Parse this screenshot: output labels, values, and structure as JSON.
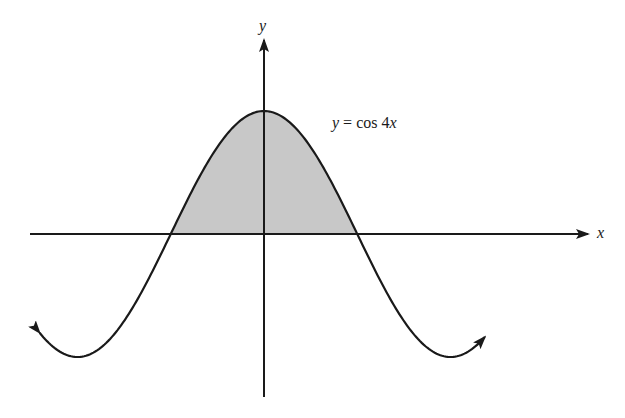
{
  "figure": {
    "function_label": {
      "var": "y",
      "eq": " = cos 4",
      "x": "x"
    },
    "x_axis_label": "x",
    "y_axis_label": "y",
    "colors": {
      "curve": "#1a1a1a",
      "axes": "#1a1a1a",
      "shaded_region": "#c8c8c8"
    }
  },
  "chart_data": {
    "type": "line",
    "title": "y = cos 4x",
    "xlabel": "x",
    "ylabel": "y",
    "function": "cos(4x)",
    "shaded_region": {
      "description": "area under y = cos 4x above the x-axis between the two zeros adjacent to the y-axis",
      "x_from": -0.3927,
      "x_to": 0.3927
    },
    "x_range_shown": [
      -0.94,
      0.94
    ],
    "y_range_shown": [
      -1.05,
      1.05
    ],
    "key_points": [
      {
        "x": 0,
        "y": 1,
        "note": "maximum on y-axis"
      },
      {
        "x": -0.3927,
        "y": 0,
        "note": "zero (-pi/8)"
      },
      {
        "x": 0.3927,
        "y": 0,
        "note": "zero (pi/8)"
      },
      {
        "x": -0.7854,
        "y": -1,
        "note": "minimum (-pi/4)"
      },
      {
        "x": 0.7854,
        "y": -1,
        "note": "minimum (pi/4)"
      }
    ],
    "curve_ends": "arrowheads at both ends",
    "grid": false,
    "tick_labels": []
  }
}
